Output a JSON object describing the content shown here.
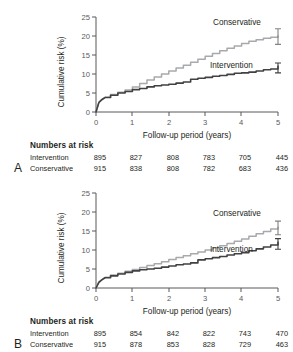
{
  "chart_data": [
    {
      "panel": "A",
      "type": "line",
      "title": "",
      "xlabel": "Follow-up period (years)",
      "ylabel": "Cumulative risk (%)",
      "xlim": [
        0,
        5
      ],
      "ylim": [
        0,
        25
      ],
      "xticks": [
        "0",
        "1",
        "2",
        "3",
        "4",
        "5"
      ],
      "yticks": [
        "0",
        "5",
        "10",
        "15",
        "20",
        "25"
      ],
      "grid": false,
      "legend_position": "inline-right",
      "series": [
        {
          "name": "Conservative",
          "color": "#a7a9ac",
          "x": [
            0,
            0.08,
            0.17,
            0.25,
            0.4,
            0.6,
            0.8,
            1.0,
            1.2,
            1.4,
            1.6,
            1.8,
            2.0,
            2.2,
            2.4,
            2.6,
            2.8,
            3.0,
            3.2,
            3.4,
            3.6,
            3.8,
            4.0,
            4.2,
            4.4,
            4.6,
            4.8,
            5.0
          ],
          "y": [
            0,
            2.6,
            3.4,
            3.9,
            4.6,
            5.2,
            5.8,
            6.6,
            7.5,
            8.4,
            9.2,
            10.0,
            10.8,
            11.6,
            12.3,
            13.1,
            13.9,
            14.7,
            15.4,
            16.1,
            16.8,
            17.4,
            18.0,
            18.6,
            19.0,
            19.4,
            19.7,
            20.0
          ],
          "endpoint_value": 20.0,
          "error_bar": {
            "x": 5,
            "low": 17.8,
            "high": 21.9
          }
        },
        {
          "name": "Intervention",
          "color": "#414042",
          "x": [
            0,
            0.08,
            0.17,
            0.25,
            0.4,
            0.6,
            0.8,
            1.0,
            1.2,
            1.4,
            1.6,
            1.8,
            2.0,
            2.2,
            2.4,
            2.6,
            2.8,
            3.0,
            3.2,
            3.4,
            3.6,
            3.8,
            4.0,
            4.2,
            4.4,
            4.6,
            4.8,
            5.0
          ],
          "y": [
            0,
            2.5,
            3.3,
            3.8,
            4.4,
            5.0,
            5.4,
            5.9,
            6.2,
            6.6,
            6.9,
            7.1,
            7.3,
            7.6,
            7.9,
            8.6,
            8.9,
            9.1,
            9.4,
            9.6,
            9.9,
            10.2,
            10.3,
            10.5,
            10.8,
            11.1,
            11.3,
            12.0
          ],
          "endpoint_value": 12.0,
          "error_bar": {
            "x": 5,
            "low": 10.3,
            "high": 12.9
          }
        }
      ],
      "numbers_at_risk": {
        "title": "Numbers at risk",
        "times": [
          "0",
          "1",
          "2",
          "3",
          "4",
          "5"
        ],
        "rows": [
          {
            "label": "Intervention",
            "values": [
              "895",
              "827",
              "808",
              "783",
              "705",
              "445"
            ]
          },
          {
            "label": "Conservative",
            "values": [
              "915",
              "838",
              "808",
              "782",
              "683",
              "436"
            ]
          }
        ]
      }
    },
    {
      "panel": "B",
      "type": "line",
      "title": "",
      "xlabel": "Follow-up period (years)",
      "ylabel": "Cumulative risk (%)",
      "xlim": [
        0,
        5
      ],
      "ylim": [
        0,
        25
      ],
      "xticks": [
        "0",
        "1",
        "2",
        "3",
        "4",
        "5"
      ],
      "yticks": [
        "0",
        "5",
        "10",
        "15",
        "20",
        "25"
      ],
      "grid": false,
      "legend_position": "inline-right",
      "series": [
        {
          "name": "Conservative",
          "color": "#a7a9ac",
          "x": [
            0,
            0.08,
            0.17,
            0.25,
            0.4,
            0.6,
            0.8,
            1.0,
            1.2,
            1.4,
            1.6,
            1.8,
            2.0,
            2.2,
            2.4,
            2.6,
            2.8,
            3.0,
            3.2,
            3.4,
            3.6,
            3.8,
            4.0,
            4.2,
            4.4,
            4.6,
            4.8,
            5.0
          ],
          "y": [
            0,
            1.6,
            2.3,
            2.8,
            3.4,
            3.9,
            4.4,
            4.9,
            5.4,
            5.9,
            6.4,
            6.9,
            7.5,
            8.0,
            8.5,
            9.0,
            9.5,
            10.0,
            10.6,
            11.1,
            11.7,
            12.3,
            12.9,
            13.6,
            14.3,
            14.9,
            15.5,
            16.0
          ],
          "endpoint_value": 16.0,
          "error_bar": {
            "x": 5,
            "low": 14.0,
            "high": 17.6
          }
        },
        {
          "name": "Intervention",
          "color": "#414042",
          "x": [
            0,
            0.08,
            0.17,
            0.25,
            0.4,
            0.6,
            0.8,
            1.0,
            1.2,
            1.4,
            1.6,
            1.8,
            2.0,
            2.2,
            2.4,
            2.6,
            2.8,
            3.0,
            3.2,
            3.4,
            3.6,
            3.8,
            4.0,
            4.2,
            4.4,
            4.6,
            4.8,
            5.0
          ],
          "y": [
            0,
            1.5,
            2.2,
            2.7,
            3.2,
            3.7,
            4.1,
            4.5,
            4.8,
            5.0,
            5.2,
            5.5,
            5.8,
            6.1,
            6.3,
            6.6,
            7.4,
            7.7,
            8.0,
            8.3,
            8.7,
            9.0,
            9.3,
            9.8,
            10.3,
            10.8,
            11.3,
            12.0
          ],
          "endpoint_value": 12.0,
          "error_bar": {
            "x": 5,
            "low": 10.2,
            "high": 13.0
          }
        }
      ],
      "numbers_at_risk": {
        "title": "Numbers at risk",
        "times": [
          "0",
          "1",
          "2",
          "3",
          "4",
          "5"
        ],
        "rows": [
          {
            "label": "Intervention",
            "values": [
              "895",
              "854",
              "842",
              "822",
              "743",
              "470"
            ]
          },
          {
            "label": "Conservative",
            "values": [
              "915",
              "878",
              "853",
              "828",
              "729",
              "463"
            ]
          }
        ]
      }
    }
  ],
  "panels": [
    {
      "letter": "A",
      "ylabel": "Cumulative risk (%)",
      "xlabel": "Follow-up period (years)",
      "label_conservative": "Conservative",
      "label_intervention": "Intervention",
      "risk_title": "Numbers at risk",
      "row0_label": "Intervention",
      "row1_label": "Conservative",
      "yt0": "0",
      "yt1": "5",
      "yt2": "10",
      "yt3": "15",
      "yt4": "20",
      "yt5": "25",
      "xt0": "0",
      "xt1": "1",
      "xt2": "2",
      "xt3": "3",
      "xt4": "4",
      "xt5": "5",
      "r0c0": "895",
      "r0c1": "827",
      "r0c2": "808",
      "r0c3": "783",
      "r0c4": "705",
      "r0c5": "445",
      "r1c0": "915",
      "r1c1": "838",
      "r1c2": "808",
      "r1c3": "782",
      "r1c4": "683",
      "r1c5": "436"
    },
    {
      "letter": "B",
      "ylabel": "Cumulative risk (%)",
      "xlabel": "Follow-up period (years)",
      "label_conservative": "Conservative",
      "label_intervention": "Intervention",
      "risk_title": "Numbers at risk",
      "row0_label": "Intervention",
      "row1_label": "Conservative",
      "yt0": "0",
      "yt1": "5",
      "yt2": "10",
      "yt3": "15",
      "yt4": "20",
      "yt5": "25",
      "xt0": "0",
      "xt1": "1",
      "xt2": "2",
      "xt3": "3",
      "xt4": "4",
      "xt5": "5",
      "r0c0": "895",
      "r0c1": "854",
      "r0c2": "842",
      "r0c3": "822",
      "r0c4": "743",
      "r0c5": "470",
      "r1c0": "915",
      "r1c1": "878",
      "r1c2": "853",
      "r1c3": "828",
      "r1c4": "729",
      "r1c5": "463"
    }
  ],
  "colors": {
    "conservative": "#a7a9ac",
    "intervention": "#414042",
    "axis": "#58595b",
    "text": "#231f20"
  }
}
